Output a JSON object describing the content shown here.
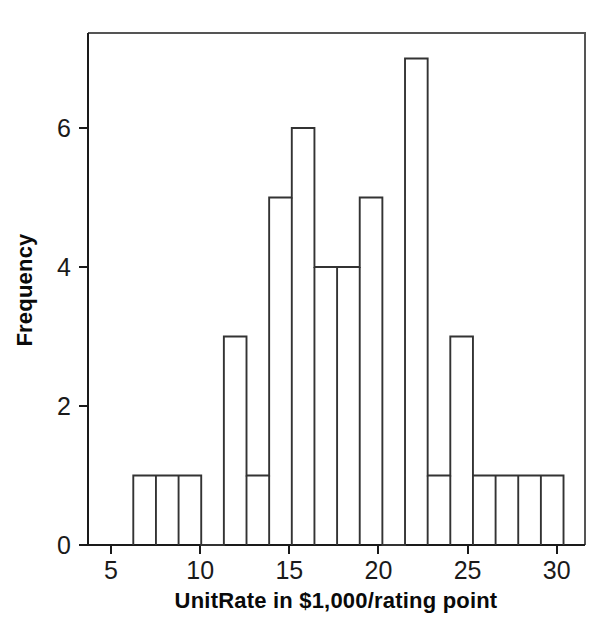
{
  "chart_data": {
    "type": "bar",
    "title": "",
    "subtitle": "",
    "xlabel": "UnitRate in $1,000/rating point",
    "ylabel": "Frequency",
    "xlim": [
      3.5,
      31.3
    ],
    "ylim": [
      0,
      7.4
    ],
    "grid": false,
    "legend": null,
    "bin_width": 1.27,
    "bin_start": 6.25,
    "bin_edges": [
      6.25,
      7.52,
      8.79,
      10.06,
      11.33,
      12.6,
      13.87,
      15.14,
      16.41,
      17.68,
      18.95,
      20.22,
      21.49,
      22.76,
      24.03,
      25.3,
      26.57,
      27.84,
      29.11,
      30.38
    ],
    "categories": [
      "6.25-7.52",
      "7.52-8.79",
      "8.79-10.06",
      "10.06-11.33",
      "11.33-12.60",
      "12.60-13.87",
      "13.87-15.14",
      "15.14-16.41",
      "16.41-17.68",
      "17.68-18.95",
      "18.95-20.22",
      "20.22-21.49",
      "21.49-22.76",
      "22.76-24.03",
      "24.03-25.30",
      "25.30-26.57",
      "26.57-27.84",
      "27.84-29.11",
      "29.11-30.38"
    ],
    "values": [
      1,
      1,
      1,
      0,
      3,
      1,
      5,
      6,
      4,
      4,
      5,
      0,
      7,
      1,
      3,
      1,
      1,
      1,
      1
    ],
    "x_ticks_major": [
      5,
      10,
      15,
      20,
      25,
      30
    ],
    "x_tick_labels": [
      "5",
      "10",
      "15",
      "20",
      "25",
      "30"
    ],
    "y_ticks_major": [
      0,
      2,
      4,
      6
    ],
    "y_tick_labels": [
      "0",
      "2",
      "4",
      "6"
    ],
    "total_count": 38,
    "colors": {
      "bar_stroke": "#333333",
      "bar_fill": "none",
      "axis": "#1a1a1a",
      "frame": "#555555",
      "background": "#ffffff",
      "text": "#0a0a0a"
    }
  },
  "figure": {
    "x_axis_label": "UnitRate in $1,000/rating point",
    "y_axis_label": "Frequency"
  }
}
